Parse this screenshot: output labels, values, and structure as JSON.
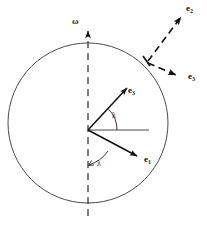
{
  "figure": {
    "type": "vector-diagram",
    "background_color": "#ffffff",
    "stroke_color": "#1a1a1a",
    "circle_stroke_color": "#4a4a4a",
    "dashed_stroke_color": "#1a1a1a"
  },
  "geometry": {
    "circle": {
      "cx": 88,
      "cy": 123,
      "r": 80
    },
    "origin": {
      "x": 88,
      "y": 130
    },
    "axis": {
      "x": 88,
      "y_top": 28,
      "y_bottom": 216
    },
    "horizontal_ray": {
      "x1": 88,
      "y1": 130,
      "x2": 149,
      "y2": 130
    },
    "surface_point": {
      "x": 147,
      "y": 62
    }
  },
  "labels": {
    "omega": "ω",
    "lambda_upper": "λ",
    "lambda_lower": "λ",
    "e_inner_up": {
      "base": "e",
      "sub": "3"
    },
    "e_inner_down": {
      "base": "e",
      "sub": "1"
    },
    "e_outer_up": {
      "base": "e",
      "sub": "2"
    },
    "e_outer_right": {
      "base": "e",
      "sub": "3"
    }
  },
  "vectors": [
    {
      "name": "omega-axis",
      "style": "dashed",
      "from": {
        "x": 88,
        "y": 216
      },
      "to": {
        "x": 88,
        "y": 28
      },
      "arrowhead": true,
      "label": "ω"
    },
    {
      "name": "e3-inner",
      "style": "solid",
      "from": {
        "x": 88,
        "y": 130
      },
      "to": {
        "x": 129,
        "y": 86
      },
      "arrowhead": true,
      "label": "e3"
    },
    {
      "name": "e1-inner",
      "style": "solid",
      "from": {
        "x": 88,
        "y": 130
      },
      "to": {
        "x": 140,
        "y": 158
      },
      "arrowhead": true,
      "label": "e1"
    },
    {
      "name": "e2-outer",
      "style": "dashed",
      "from": {
        "x": 147,
        "y": 62
      },
      "to": {
        "x": 184,
        "y": 13
      },
      "arrowhead": true,
      "label": "e2"
    },
    {
      "name": "e3-outer",
      "style": "dashed",
      "from": {
        "x": 147,
        "y": 62
      },
      "to": {
        "x": 181,
        "y": 77
      },
      "arrowhead": true,
      "label": "e3"
    },
    {
      "name": "horizontal-reference",
      "style": "solid",
      "from": {
        "x": 88,
        "y": 130
      },
      "to": {
        "x": 149,
        "y": 130
      },
      "arrowhead": false,
      "label": ""
    }
  ],
  "angles": [
    {
      "name": "lambda-upper",
      "label": "λ",
      "vertex": {
        "x": 88,
        "y": 130
      },
      "between": [
        "horizontal-reference",
        "e3-inner"
      ],
      "label_pos": {
        "x": 114,
        "y": 113
      }
    },
    {
      "name": "lambda-lower",
      "label": "λ",
      "vertex": {
        "x": 88,
        "y": 130
      },
      "between": [
        "omega-axis-down",
        "e1-inner"
      ],
      "label_pos": {
        "x": 99,
        "y": 162
      }
    }
  ]
}
